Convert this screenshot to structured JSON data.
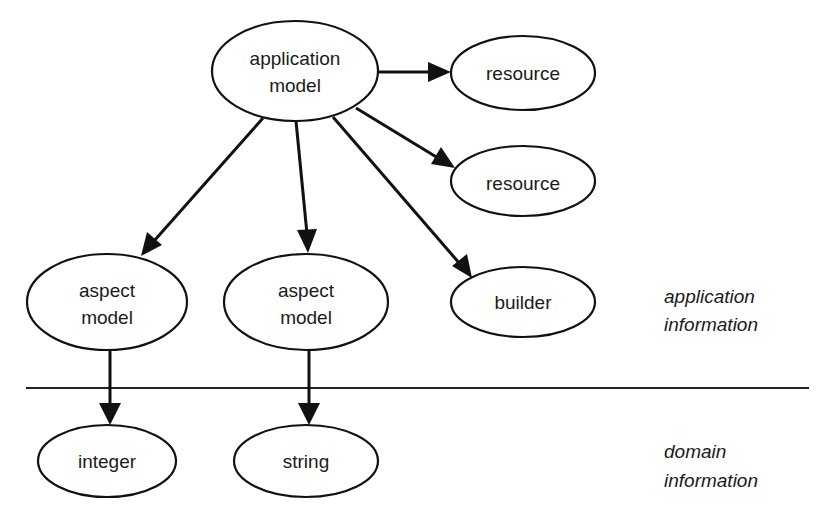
{
  "diagram": {
    "nodes": {
      "application_model": {
        "line1": "application",
        "line2": "model"
      },
      "resource_1": {
        "label": "resource"
      },
      "resource_2": {
        "label": "resource"
      },
      "aspect_model_1": {
        "line1": "aspect",
        "line2": "model"
      },
      "aspect_model_2": {
        "line1": "aspect",
        "line2": "model"
      },
      "builder": {
        "label": "builder"
      },
      "integer": {
        "label": "integer"
      },
      "string": {
        "label": "string"
      }
    },
    "edges": [
      {
        "from": "application model",
        "to": "resource (top)"
      },
      {
        "from": "application model",
        "to": "resource (middle)"
      },
      {
        "from": "application model",
        "to": "aspect model (left)"
      },
      {
        "from": "application model",
        "to": "aspect model (center)"
      },
      {
        "from": "application model",
        "to": "builder"
      },
      {
        "from": "aspect model (left)",
        "to": "integer"
      },
      {
        "from": "aspect model (center)",
        "to": "string"
      }
    ],
    "regions": {
      "application": {
        "line1": "application",
        "line2": "information"
      },
      "domain": {
        "line1": "domain",
        "line2": "information"
      }
    },
    "colors": {
      "stroke": "#111111",
      "background": "#ffffff"
    }
  }
}
